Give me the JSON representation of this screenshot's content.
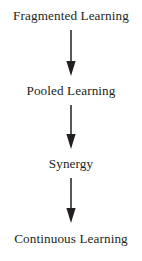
{
  "diagram": {
    "orientation": "vertical-top-to-bottom",
    "background_color": "#ffffff",
    "text_color": "#231f20",
    "arrow_color": "#231f20",
    "nodes": [
      {
        "label": "Fragmented Learning"
      },
      {
        "label": "Pooled Learning"
      },
      {
        "label": "Synergy"
      },
      {
        "label": "Continuous Learning"
      }
    ],
    "connectors": [
      {
        "icon": "down-arrow-icon",
        "from": "Fragmented Learning",
        "to": "Pooled Learning"
      },
      {
        "icon": "down-arrow-icon",
        "from": "Pooled Learning",
        "to": "Synergy"
      },
      {
        "icon": "down-arrow-icon",
        "from": "Synergy",
        "to": "Continuous Learning"
      }
    ]
  }
}
